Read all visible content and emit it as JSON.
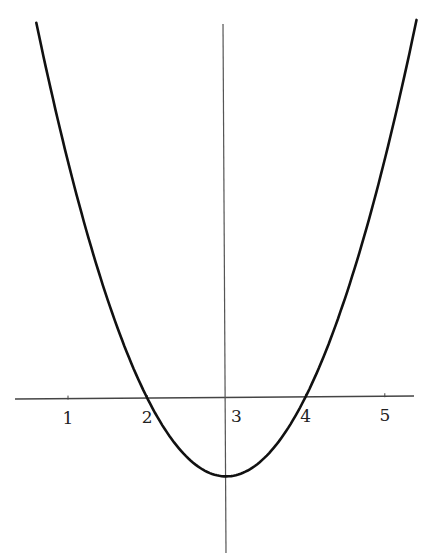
{
  "chart_data": {
    "type": "line",
    "title": "",
    "xlabel": "",
    "ylabel": "",
    "function": "y = (x - 2)(x - 4) = (x - 3)^2 - 1",
    "x_ticks": [
      1,
      2,
      3,
      4,
      5
    ],
    "tick_labels": [
      "1",
      "2",
      "3",
      "4",
      "5"
    ],
    "xlim": [
      0.4,
      5.6
    ],
    "ylim": [
      -2.0,
      4.7
    ],
    "grid": false,
    "legend": null,
    "series": [
      {
        "name": "parabola",
        "x": [
          0.6,
          1.0,
          1.5,
          2.0,
          2.5,
          3.0,
          3.5,
          4.0,
          4.5,
          5.0,
          5.4
        ],
        "values": [
          4.76,
          3.0,
          1.25,
          0.0,
          -0.75,
          -1.0,
          -0.75,
          0.0,
          1.25,
          3.0,
          4.76
        ]
      }
    ],
    "roots": [
      2,
      4
    ],
    "vertex": [
      3,
      -1
    ],
    "colors": {
      "curve": "#111111",
      "axis": "#333333"
    }
  }
}
